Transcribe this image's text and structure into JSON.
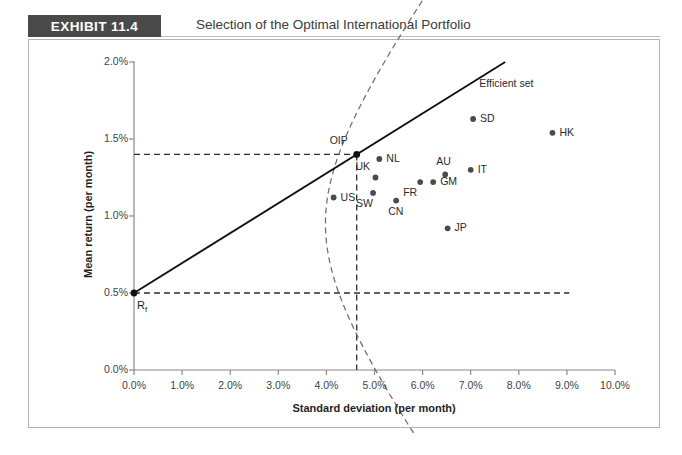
{
  "exhibit": {
    "badge": "EXHIBIT 11.4",
    "title": "Selection of the Optimal International Portfolio"
  },
  "chart_data": {
    "type": "scatter",
    "title": "Selection of the Optimal International Portfolio",
    "xlabel": "Standard deviation (per month)",
    "ylabel": "Mean return (per month)",
    "xlim": [
      0.0,
      10.0
    ],
    "ylim": [
      0.0,
      2.0
    ],
    "xticks": [
      "0.0%",
      "1.0%",
      "2.0%",
      "3.0%",
      "4.0%",
      "5.0%",
      "6.0%",
      "7.0%",
      "8.0%",
      "9.0%",
      "10.0%"
    ],
    "yticks": [
      "0.0%",
      "0.5%",
      "1.0%",
      "1.5%",
      "2.0%"
    ],
    "grid": false,
    "legend": false,
    "points": [
      {
        "name": "US",
        "x": 4.15,
        "y": 1.12,
        "label_pos": "right"
      },
      {
        "name": "SW",
        "x": 4.97,
        "y": 1.15,
        "label_pos": "below-left"
      },
      {
        "name": "UK",
        "x": 5.02,
        "y": 1.25,
        "label_pos": "above-left"
      },
      {
        "name": "NL",
        "x": 5.1,
        "y": 1.37,
        "label_pos": "right"
      },
      {
        "name": "CN",
        "x": 5.45,
        "y": 1.1,
        "label_pos": "below"
      },
      {
        "name": "FR",
        "x": 5.95,
        "y": 1.22,
        "label_pos": "below-left"
      },
      {
        "name": "GM",
        "x": 6.22,
        "y": 1.22,
        "label_pos": "right"
      },
      {
        "name": "AU",
        "x": 6.47,
        "y": 1.27,
        "label_pos": "above"
      },
      {
        "name": "JP",
        "x": 6.52,
        "y": 0.92,
        "label_pos": "right"
      },
      {
        "name": "IT",
        "x": 7.0,
        "y": 1.3,
        "label_pos": "right"
      },
      {
        "name": "SD",
        "x": 7.05,
        "y": 1.63,
        "label_pos": "right"
      },
      {
        "name": "HK",
        "x": 8.7,
        "y": 1.54,
        "label_pos": "right"
      }
    ],
    "special_points": [
      {
        "name": "Rf",
        "display": "R",
        "subscript": "f",
        "x": 0.0,
        "y": 0.5
      },
      {
        "name": "OIP",
        "display": "OIP",
        "x": 4.63,
        "y": 1.4
      }
    ],
    "annotations": [
      {
        "text": "Efficient set",
        "x": 7.85,
        "y": 1.88
      },
      {
        "text": "OIP",
        "x": 4.45,
        "y": 1.5
      },
      {
        "text": "R",
        "subscript": "f",
        "x": 0.12,
        "y": 0.36
      }
    ],
    "lines": [
      {
        "name": "capital-market-line",
        "style": "solid",
        "from": [
          0.0,
          0.5
        ],
        "to": [
          5.82,
          2.0
        ]
      },
      {
        "name": "efficient-set-frontier",
        "style": "dashed",
        "shape": "hyperbola"
      },
      {
        "name": "oip-horizontal-guide",
        "style": "dashed",
        "y": 1.4,
        "from_x": 0.0,
        "to_x": 4.63
      },
      {
        "name": "oip-vertical-guide",
        "style": "dashed",
        "x": 4.63,
        "from_y": 0.0,
        "to_y": 1.4
      },
      {
        "name": "rf-horizontal-guide",
        "style": "dashed",
        "y": 0.5,
        "from_x": 0.0,
        "to_x": 9.05
      }
    ],
    "colors": {
      "marker": "#4b4b4b",
      "solid_line": "#111111",
      "dashed_line": "#6e6e6e",
      "axis": "#8a8a8a",
      "text": "#2b2b2b",
      "badge_bg": "#4a4a4a"
    }
  }
}
